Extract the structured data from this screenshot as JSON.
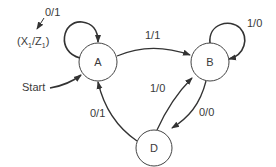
{
  "diagram": {
    "type": "state-diagram",
    "states": [
      {
        "id": "A",
        "label": "A"
      },
      {
        "id": "B",
        "label": "B"
      },
      {
        "id": "D",
        "label": "D"
      }
    ],
    "start_label": "Start",
    "io_legend": {
      "x": "X",
      "x_sub": "1",
      "z": "Z",
      "z_sub": "1"
    },
    "transitions": [
      {
        "from": "A",
        "to": "A",
        "label": "0/1"
      },
      {
        "from": "A",
        "to": "B",
        "label": "1/1"
      },
      {
        "from": "B",
        "to": "B",
        "label": "1/0"
      },
      {
        "from": "B",
        "to": "D",
        "label": "0/0"
      },
      {
        "from": "D",
        "to": "B",
        "label": "1/0"
      },
      {
        "from": "D",
        "to": "A",
        "label": "0/1"
      }
    ]
  }
}
